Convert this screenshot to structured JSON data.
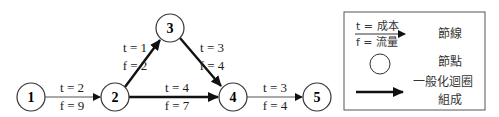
{
  "diagram": {
    "nodes": [
      {
        "id": "1",
        "label": "1",
        "cx": 31,
        "cy": 97
      },
      {
        "id": "2",
        "label": "2",
        "cx": 115,
        "cy": 97
      },
      {
        "id": "3",
        "label": "3",
        "cx": 170,
        "cy": 28
      },
      {
        "id": "4",
        "label": "4",
        "cx": 233,
        "cy": 97
      },
      {
        "id": "5",
        "label": "5",
        "cx": 317,
        "cy": 97
      }
    ],
    "edges": [
      {
        "from": "1",
        "to": "2",
        "t": "t = 2",
        "f": "f = 9",
        "bold": false
      },
      {
        "from": "2",
        "to": "3",
        "t": "t = 1",
        "f": "f = 2",
        "bold": true
      },
      {
        "from": "3",
        "to": "4",
        "t": "t = 3",
        "f": "f = 4",
        "bold": true
      },
      {
        "from": "2",
        "to": "4",
        "t": "t = 4",
        "f": "f = 7",
        "bold": true
      },
      {
        "from": "4",
        "to": "5",
        "t": "t = 3",
        "f": "f = 4",
        "bold": false
      }
    ]
  },
  "legend": {
    "edge_t": "t = 成本",
    "edge_f": "f = 流量",
    "edge_label": "節線",
    "node_label": "節點",
    "cycle_label_line1": "一般化迴圈",
    "cycle_label_line2": "組成"
  }
}
